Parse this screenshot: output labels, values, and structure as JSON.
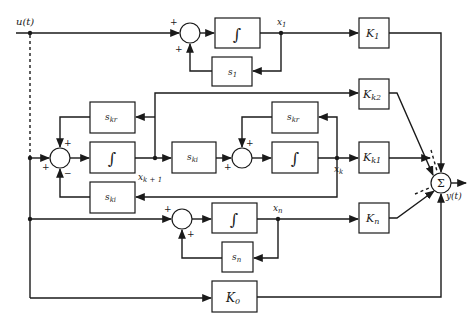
{
  "diagram": {
    "type": "block-diagram",
    "input_label": "u(t)",
    "output_label": "y(t)",
    "output_summer_symbol": "Σ",
    "integrator_symbol": "∫",
    "signs": {
      "plus": "+",
      "minus": "−"
    },
    "branch_1": {
      "state_label": "x",
      "state_sub": "1",
      "feedback_block": "s",
      "feedback_sub": "1",
      "gain_block": "K",
      "gain_sub": "1"
    },
    "branch_complex": {
      "state_a_label": "x",
      "state_a_sub": "k + 1",
      "state_b_label": "x",
      "state_b_sub": "k",
      "block_real": "s",
      "block_real_sub": "kr",
      "block_imag": "s",
      "block_imag_sub": "ki",
      "gain_a": "K",
      "gain_a_sub": "k2",
      "gain_b": "K",
      "gain_b_sub": "k1"
    },
    "branch_n": {
      "state_label": "x",
      "state_sub": "n",
      "feedback_block": "s",
      "feedback_sub": "n",
      "gain_block": "K",
      "gain_sub": "n"
    },
    "direct_gain": {
      "label": "K",
      "sub": "0"
    }
  }
}
